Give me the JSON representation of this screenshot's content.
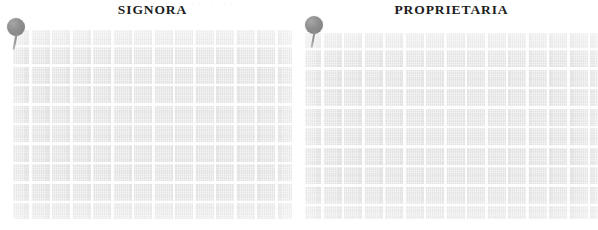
{
  "page": {
    "background_color": "#ffffff",
    "top_sliver_text": "· · · · · · · · · · · · ·"
  },
  "panels": [
    {
      "id": "signora",
      "title": "SIGNORA",
      "swatch": {
        "name": "fabric-swatch",
        "base_color": "#e9e9e9",
        "grid_line_color": "#ffffff"
      },
      "pin": {
        "name": "pin-marker",
        "head_color": "#8a8a8a",
        "needle_color": "#9a9a9a"
      }
    },
    {
      "id": "proprietaria",
      "title": "PROPRIETARIA",
      "swatch": {
        "name": "fabric-swatch",
        "base_color": "#e9e9e9",
        "grid_line_color": "#ffffff"
      },
      "pin": {
        "name": "pin-marker",
        "head_color": "#8a8a8a",
        "needle_color": "#9a9a9a"
      }
    }
  ]
}
